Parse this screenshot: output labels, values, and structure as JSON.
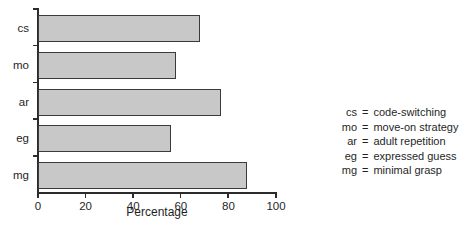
{
  "chart_data": {
    "type": "bar",
    "orientation": "horizontal",
    "title": "",
    "xlabel": "Percentage",
    "ylabel": "",
    "categories": [
      "cs",
      "mo",
      "ar",
      "eg",
      "mg"
    ],
    "values": [
      68,
      58,
      77,
      56,
      88
    ],
    "xlim": [
      0,
      100
    ],
    "xticks": [
      0,
      20,
      40,
      60,
      80,
      100
    ],
    "xtick_labels": [
      "0",
      "20",
      "40",
      "60",
      "80",
      "100"
    ],
    "grid": false,
    "legend_position": "right-outside",
    "bar_fill_color": "#c8c8c8",
    "bar_edge_color": "#3a3a3a",
    "axis_color": "#2b2b2b",
    "background_color": "#ffffff",
    "series": [
      {
        "name": "Percentage",
        "values": [
          68,
          58,
          77,
          56,
          88
        ]
      }
    ],
    "annotations": []
  },
  "axis": {
    "x_title": "Percentage",
    "tick_labels": [
      "0",
      "20",
      "40",
      "60",
      "80",
      "100"
    ],
    "category_labels": [
      "cs",
      "mo",
      "ar",
      "eg",
      "mg"
    ]
  },
  "legend": {
    "entries": [
      {
        "abbr": "cs",
        "eq": "=",
        "description": "code-switching"
      },
      {
        "abbr": "mo",
        "eq": "=",
        "description": "move-on strategy"
      },
      {
        "abbr": "ar",
        "eq": "=",
        "description": "adult repetition"
      },
      {
        "abbr": "eg",
        "eq": "=",
        "description": "expressed guess"
      },
      {
        "abbr": "mg",
        "eq": "=",
        "description": "minimal grasp"
      }
    ]
  }
}
